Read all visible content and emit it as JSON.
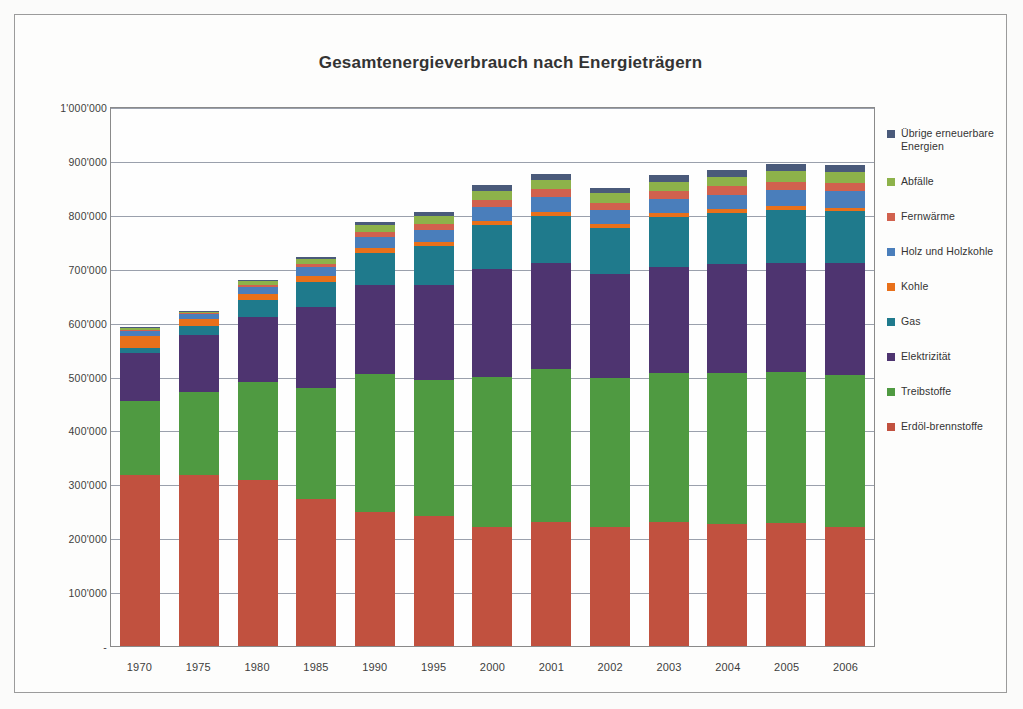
{
  "chart_data": {
    "type": "bar",
    "stacked": true,
    "title": "Gesamtenergieverbrauch nach Energieträgern",
    "xlabel": "",
    "ylabel": "",
    "ylim": [
      0,
      1000000
    ],
    "grid": true,
    "legend_position": "right",
    "ytick_labels": [
      "1'000'000",
      "900'000",
      "800'000",
      "700'000",
      "600'000",
      "500'000",
      "400'000",
      "300'000",
      "200'000",
      "100'000",
      "-"
    ],
    "ytick_values": [
      1000000,
      900000,
      800000,
      700000,
      600000,
      500000,
      400000,
      300000,
      200000,
      100000,
      0
    ],
    "categories": [
      "1970",
      "1975",
      "1980",
      "1985",
      "1990",
      "1995",
      "2000",
      "2001",
      "2002",
      "2003",
      "2004",
      "2005",
      "2006"
    ],
    "series": [
      {
        "name": "Erdöl-\nbrennstoffe",
        "legend_label": "Erdöl-brennstoffe",
        "color": "#C1513F",
        "values": [
          318000,
          318000,
          310000,
          275000,
          250000,
          242000,
          222000,
          231000,
          222000,
          232000,
          228000,
          229000,
          222000
        ]
      },
      {
        "name": "Treibstoffe",
        "legend_label": "Treibstoffe",
        "color": "#4F9A41",
        "values": [
          138000,
          155000,
          180000,
          205000,
          255000,
          253000,
          278000,
          284000,
          277000,
          276000,
          280000,
          280000,
          282000
        ]
      },
      {
        "name": "Elektrizität",
        "legend_label": "Elektrizität",
        "color": "#4E3470",
        "values": [
          88000,
          105000,
          122000,
          149000,
          165000,
          175000,
          200000,
          196000,
          191000,
          196000,
          201000,
          203000,
          207000
        ]
      },
      {
        "name": "Gas",
        "legend_label": "Gas",
        "color": "#1F7A8C",
        "values": [
          10000,
          16000,
          30000,
          47000,
          60000,
          72000,
          82000,
          88000,
          86000,
          92000,
          95000,
          98000,
          96000
        ]
      },
      {
        "name": "Kohle",
        "legend_label": "Kohle",
        "color": "#E8701A",
        "values": [
          22000,
          13000,
          12000,
          11000,
          9000,
          8000,
          7000,
          7000,
          7000,
          7000,
          7000,
          7000,
          7000
        ]
      },
      {
        "name": "Holz und Holzkohle",
        "legend_label": "Holz und Holzkohle",
        "color": "#4A7EBB",
        "values": [
          9000,
          9000,
          13000,
          16000,
          21000,
          23000,
          26000,
          28000,
          26000,
          27000,
          27000,
          29000,
          30000
        ]
      },
      {
        "name": "Fernwärme",
        "legend_label": "Fernwärme",
        "color": "#D1614E",
        "values": [
          2000,
          2000,
          4000,
          6000,
          9000,
          11000,
          13000,
          14000,
          14000,
          14000,
          15000,
          16000,
          16000
        ]
      },
      {
        "name": "Abfälle",
        "legend_label": "Abfälle",
        "color": "#8DB24A",
        "values": [
          3000,
          3000,
          6000,
          9000,
          12000,
          14000,
          17000,
          17000,
          17000,
          18000,
          18000,
          19000,
          19000
        ]
      },
      {
        "name": "Übrige erneuerbare Energien",
        "legend_label": "Übrige erneuerbare Energien",
        "color": "#4A5A7A",
        "values": [
          2000,
          2000,
          3000,
          4000,
          6000,
          7000,
          10000,
          11000,
          11000,
          12000,
          12000,
          13000,
          13000
        ]
      }
    ],
    "legend_entries": [
      {
        "label": "Übrige erneuerbare Energien",
        "color": "#4A5A7A"
      },
      {
        "label": "Abfälle",
        "color": "#8DB24A"
      },
      {
        "label": "Fernwärme",
        "color": "#D1614E"
      },
      {
        "label": "Holz und Holzkohle",
        "color": "#4A7EBB"
      },
      {
        "label": "Kohle",
        "color": "#E8701A"
      },
      {
        "label": "Gas",
        "color": "#1F7A8C"
      },
      {
        "label": "Elektrizität",
        "color": "#4E3470"
      },
      {
        "label": "Treibstoffe",
        "color": "#4F9A41"
      },
      {
        "label": "Erdöl-brennstoffe",
        "color": "#C1513F"
      }
    ]
  }
}
